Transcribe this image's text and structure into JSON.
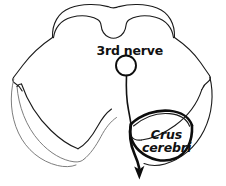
{
  "figure": {
    "background_color": "#ffffff",
    "ink_color": "#111111",
    "highlight_color": "#0d0d0d",
    "faint_color": "#6e6e6e",
    "width": 226,
    "height": 186
  },
  "labels": {
    "third_nerve": "3rd nerve",
    "crus_line1": "Crus",
    "crus_cerebri_full": "Crus cerebri",
    "crus_line2": "cerebri",
    "bottom_caption": ""
  },
  "annotations": {
    "nucleus_marker_name": "third-nerve-nucleus-circle",
    "leader_line_name": "third-nerve-fiber-line",
    "pointer_name": "crus-cerebri-arrow"
  },
  "structures": [
    {
      "name": "tectum-colliculi",
      "label": "",
      "description": "dorsal tectal plate with midline notch"
    },
    {
      "name": "midbrain-outline",
      "label": "",
      "description": "overall cross-sectional silhouette"
    },
    {
      "name": "crus-cerebri-right",
      "label": "Crus cerebri",
      "description": "emphasized thick outlined lens-shaped bundle, right side"
    },
    {
      "name": "crus-cerebri-left",
      "label": "",
      "description": "faintly drawn mirror structure, left side"
    },
    {
      "name": "interpeduncular-fossa",
      "label": "",
      "description": "central ventral notch between peduncles"
    },
    {
      "name": "third-nerve-nucleus",
      "label": "3rd nerve",
      "description": "small circle in central tegmentum with descending fiber"
    }
  ]
}
